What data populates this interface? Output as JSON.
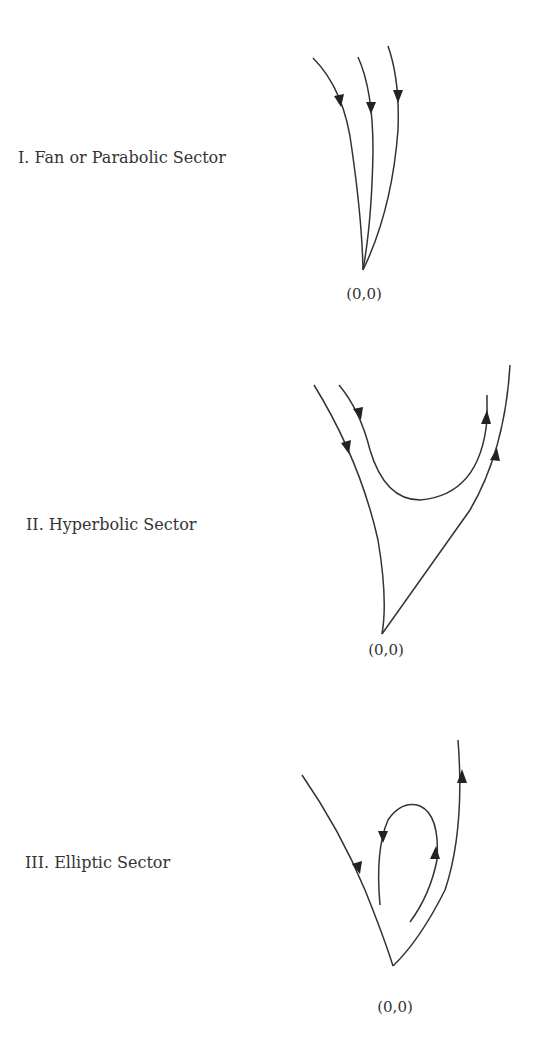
{
  "sectors": [
    {
      "id": "fan",
      "label": "I. Fan or Parabolic Sector",
      "origin_label": "(0,0)"
    },
    {
      "id": "hyperbolic",
      "label": "II. Hyperbolic Sector",
      "origin_label": "(0,0)"
    },
    {
      "id": "elliptic",
      "label": "III. Elliptic Sector",
      "origin_label": "(0,0)"
    }
  ],
  "colors": {
    "stroke": "#333333",
    "text": "#333333",
    "background": "#ffffff"
  }
}
